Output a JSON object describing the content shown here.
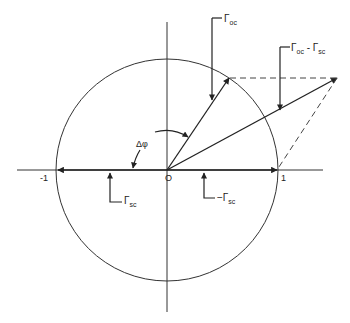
{
  "diagram": {
    "type": "unit-circle-phasor",
    "colors": {
      "stroke": "#222222",
      "background": "#ffffff"
    },
    "origin_label": "O",
    "axis_labels": {
      "neg_one": "-1",
      "pos_one": "1"
    },
    "angle_label": "Δφ",
    "vectors": [
      {
        "id": "gamma_oc",
        "label_main": "Γ",
        "label_sub": "oc"
      },
      {
        "id": "gamma_oc_minus_sc",
        "label_main": "Γ",
        "label_sub": "oc",
        "label_mid": " - Γ",
        "label_sub2": "sc"
      },
      {
        "id": "gamma_sc",
        "label_main": "Γ",
        "label_sub": "sc"
      },
      {
        "id": "neg_gamma_sc",
        "label_main": "−Γ",
        "label_sub": "sc"
      }
    ]
  }
}
